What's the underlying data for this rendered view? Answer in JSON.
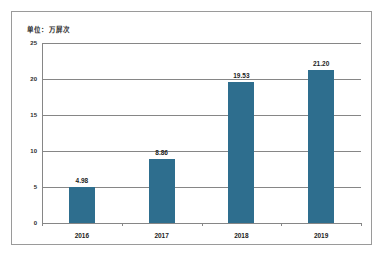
{
  "chart_data": {
    "type": "bar",
    "title": "",
    "subtitle": "",
    "unit_caption": "单位：万屏次",
    "categories": [
      "2016",
      "2017",
      "2018",
      "2019"
    ],
    "values": [
      4.98,
      8.86,
      19.53,
      21.2
    ],
    "data_labels": [
      "4.98",
      "8.86",
      "19.53",
      "21.20"
    ],
    "series": [
      {
        "name": "",
        "values": [
          4.98,
          8.86,
          19.53,
          21.2
        ],
        "color": "#2e6e8e"
      }
    ],
    "xlabel": "",
    "ylabel": "",
    "ylim": [
      0,
      25
    ],
    "ytick_labels": [
      "0",
      "5",
      "10",
      "15",
      "20",
      "25"
    ],
    "ytick_values": [
      0,
      5,
      10,
      15,
      20,
      25
    ],
    "grid": true,
    "grid_axis": "y",
    "legend": false,
    "legend_position": "none",
    "bar_color": "#2e6e8e",
    "gridline_color": "#868686",
    "frame_color": "#9a9a9a",
    "background": "#ffffff"
  }
}
